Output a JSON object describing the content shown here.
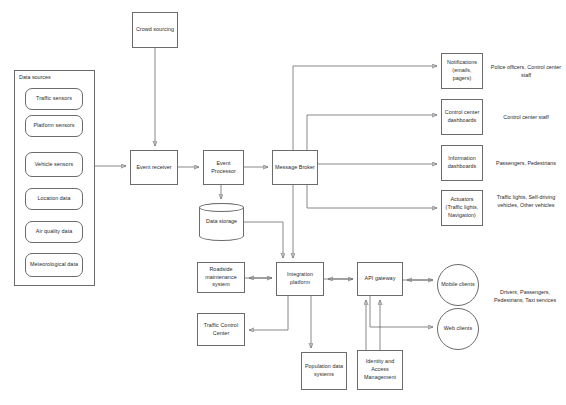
{
  "diagram": {
    "stroke_color": "#6b6b6b",
    "text_color": "#2b2b2b",
    "background": "#ffffff"
  },
  "data_sources": {
    "group_label": "Data sources",
    "items": [
      {
        "label": "Traffic sensors"
      },
      {
        "label": "Platform sensors"
      },
      {
        "label": "Vehicle sensors"
      },
      {
        "label": "Location data"
      },
      {
        "label": "Air quality data"
      },
      {
        "label": "Meteorological data"
      }
    ]
  },
  "pipeline": {
    "crowd_sourcing": "Crowd sourcing",
    "event_receiver": "Event receiver",
    "event_processor": "Event Processor",
    "message_broker": "Message Broker",
    "data_storage": "Data storage"
  },
  "consumers": [
    {
      "label": "Notifications (emails, pagers)",
      "annotation": "Police officers, Control center staff"
    },
    {
      "label": "Control center dashboards",
      "annotation": "Control center staff"
    },
    {
      "label": "Information dashboards",
      "annotation": "Passengers, Pedestrians"
    },
    {
      "label": "Actuators (Traffic lights, Navigation)",
      "annotation": "Traffic lights, Self-driving vehicles, Other vehicles"
    }
  ],
  "integration": {
    "roadside_maintenance": "Roadside maintenance system",
    "traffic_control_center": "Traffic Control Center",
    "integration_platform": "Integration platform",
    "population_data_systems": "Population data systems",
    "api_gateway": "API gateway",
    "identity_access_management": "Identity and Access Management"
  },
  "clients": {
    "mobile": "Mobile clients",
    "web": "Web clients",
    "annotation": "Drivers, Passengers, Pedestrians, Taxi services"
  }
}
